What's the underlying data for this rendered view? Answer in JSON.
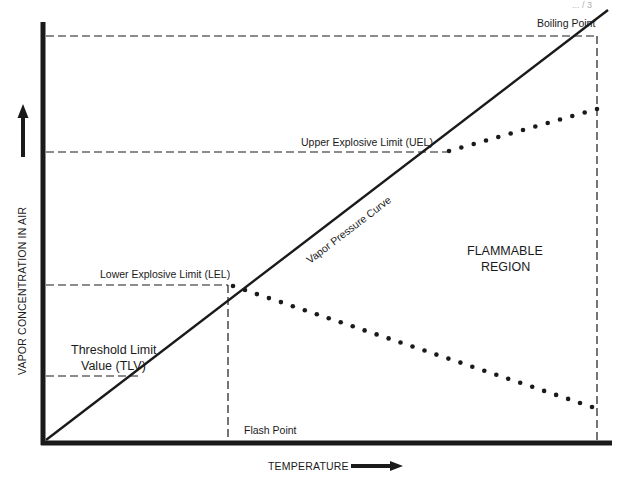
{
  "diagram": {
    "type": "flammability-diagram",
    "header_fragment": "... / 3",
    "axes": {
      "x_label": "TEMPERATURE",
      "y_label": "VAPOR CONCENTRATION IN AIR",
      "x_arrow_icon": "arrow-right-icon",
      "y_arrow_icon": "arrow-up-icon"
    },
    "curve": {
      "label": "Vapor Pressure Curve"
    },
    "levels": {
      "boiling_point": "Boiling Point",
      "upper_limit": "Upper Explosive Limit (UEL)",
      "lower_limit": "Lower Explosive Limit (LEL)",
      "tlv_line1": "Threshold Limit",
      "tlv_line2": "Value (TLV)",
      "flash_point": "Flash Point"
    },
    "region": {
      "line1": "FLAMMABLE",
      "line2": "REGION"
    },
    "relative_positions": {
      "note": "fractions of axis range (0 = origin, 1 = boiling point)",
      "tlv_concentration": 0.16,
      "lel_concentration": 0.38,
      "uel_concentration": 0.71,
      "flash_point_temperature": 0.33,
      "upper_dotted_end_concentration": 0.81,
      "lower_dotted_end_concentration": 0.08
    },
    "colors": {
      "ink": "#1a1a1a",
      "background": "#ffffff"
    }
  }
}
